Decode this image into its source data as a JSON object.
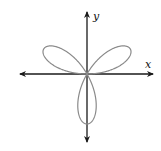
{
  "chart_data": {
    "type": "line",
    "title": "",
    "equation_form": "r = a sin(3θ)",
    "petals": 3,
    "petal_directions_deg": [
      90,
      210,
      330
    ],
    "xlabel": "x",
    "ylabel": "y",
    "grid": false,
    "tick_labels": [],
    "axes": {
      "x_arrows": "both",
      "y_arrows": "both"
    },
    "colors": {
      "curve": "#8a8a8a",
      "axes": "#1a1a1a"
    }
  },
  "labels": {
    "x": "x",
    "y": "y"
  }
}
